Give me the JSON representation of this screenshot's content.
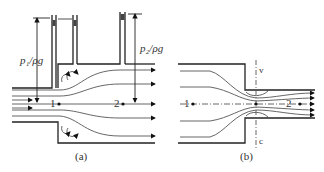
{
  "figure_a": {
    "caption": "(a)",
    "head1_label": "p₁/ρg",
    "head2_label": "p₂/ρg",
    "point1": "1",
    "point2": "2"
  },
  "figure_b": {
    "caption": "(b)",
    "point1": "1",
    "point2": "2",
    "vena_top": "v",
    "vena_bottom": "c"
  },
  "colors": {
    "line": "#222222",
    "stream": "#555555",
    "text": "#333333"
  }
}
